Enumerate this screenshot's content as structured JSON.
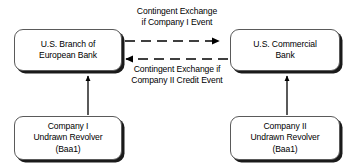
{
  "diagram": {
    "background_color": "#ffffff",
    "line_color": "#000000",
    "nodes": [
      {
        "id": "eu-bank",
        "label": "U.S. Branch of\nEuropean Bank",
        "position": "top-left"
      },
      {
        "id": "us-bank",
        "label": "U.S. Commercial\nBank",
        "position": "top-right"
      },
      {
        "id": "company1",
        "label": "Company I\nUndrawn Revolver\n(Baa1)",
        "position": "bottom-left"
      },
      {
        "id": "company2",
        "label": "Company II\nUndrawn Revolver\n(Baa1)",
        "position": "bottom-right"
      }
    ],
    "edges": [
      {
        "id": "top-edge",
        "label": "Contingent Exchange\nif Company I Event",
        "style": "dashed",
        "direction": "left-to-right",
        "from": "eu-bank",
        "to": "us-bank"
      },
      {
        "id": "bottom-edge",
        "label": "Contingent Exchange if\nCompany II Credit Event",
        "style": "dashed",
        "direction": "right-to-left",
        "from": "us-bank",
        "to": "eu-bank"
      },
      {
        "id": "left-vertical-edge",
        "label": "",
        "style": "solid",
        "direction": "bottom-to-top",
        "from": "company1",
        "to": "eu-bank"
      },
      {
        "id": "right-vertical-edge",
        "label": "",
        "style": "solid",
        "direction": "bottom-to-top",
        "from": "company2",
        "to": "us-bank"
      }
    ]
  }
}
